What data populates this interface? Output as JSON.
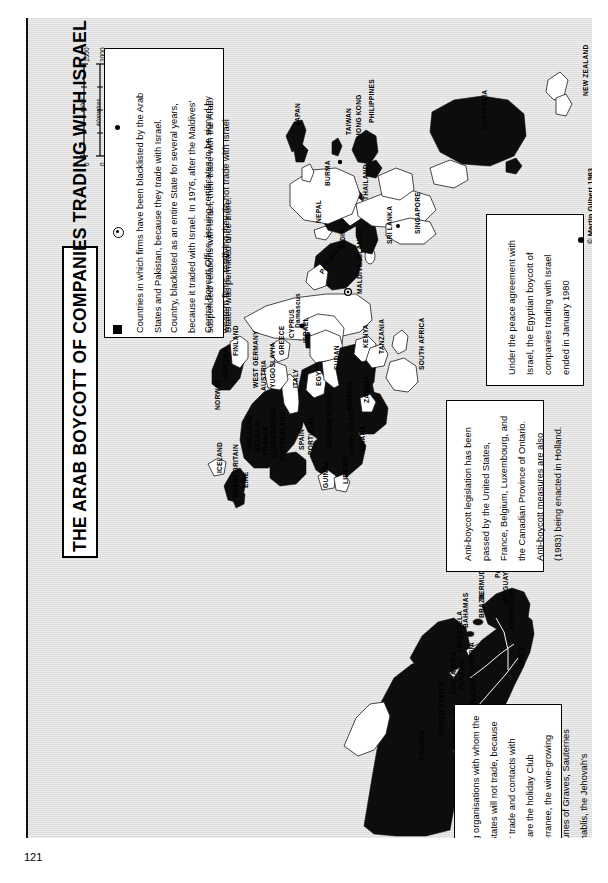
{
  "page": {
    "folio": "121",
    "credit": "© Martin Gilbert 1983"
  },
  "title": "THE ARAB BOYCOTT OF COMPANIES TRADING WITH ISRAEL",
  "scale": {
    "zero_left": "0",
    "miles_label": "miles",
    "miles_mid": "1500",
    "km_label": "kilometres",
    "km_max": "3000",
    "zero_bottom": "0"
  },
  "legend": {
    "items": [
      {
        "symbol": "filled-square",
        "text": "Countries in which firms have been blacklisted by the Arab States and Pakistan, because they trade with Israel."
      },
      {
        "symbol": "circle-dot",
        "text": "Country, blacklisted as an entire State for several years, because it traded with Israel. In 1976, after the Maldives' suspended' relations with Israel, their trade with the Arab States was permitted once more."
      },
      {
        "symbol": "dot",
        "text": "Central Boycott Office, issuing certificates to be signed by western firms, testifying they do not trade with Israel"
      }
    ]
  },
  "notes": {
    "peace": "Under the peace agreement with Israel, the Egyptian boycott of companies trading with Israel ended in January 1980",
    "anti_boycott": "Anti-boycott legislation has been passed by the United States, France, Belgium, Luxembourg, and the Canadian Province of Ontario. Anti-boycott measures are also (1983) being enacted in Holland.",
    "organisations": "Among organisations with whom the Arab States will not trade, because of their trade and contacts with Israel, are the holiday Club Mediterranee, the wine-growing communes of Graves, Sauternes and Chablis, the Jehovah's Witnesses and the Yale Glee Club"
  },
  "map_labels": [
    {
      "name": "NEW ZEALAND",
      "x": 556,
      "y": 78,
      "rot": -90
    },
    {
      "name": "AUSTRALIA",
      "x": 455,
      "y": 112,
      "rot": -90
    },
    {
      "name": "JAPAN",
      "x": 268,
      "y": 108,
      "rot": -90
    },
    {
      "name": "PHILIPPINES",
      "x": 342,
      "y": 105,
      "rot": -90
    },
    {
      "name": "TAIWAN",
      "x": 319,
      "y": 117,
      "rot": -90
    },
    {
      "name": "HONG KONG",
      "x": 329,
      "y": 120,
      "rot": -90
    },
    {
      "name": "BURMA",
      "x": 298,
      "y": 168,
      "rot": -90
    },
    {
      "name": "THAILAND",
      "x": 336,
      "y": 182,
      "rot": -90
    },
    {
      "name": "SINGAPORE",
      "x": 388,
      "y": 216,
      "rot": -90
    },
    {
      "name": "SRI LANKA",
      "x": 360,
      "y": 226,
      "rot": -90
    },
    {
      "name": "INDIA",
      "x": 313,
      "y": 230,
      "rot": -90
    },
    {
      "name": "NEPAL",
      "x": 289,
      "y": 205,
      "rot": -90
    },
    {
      "name": "PAKISTAN",
      "x": 292,
      "y": 253,
      "rot": -55
    },
    {
      "name": "MALDIVE ISLANDS",
      "x": 330,
      "y": 276,
      "rot": -90
    },
    {
      "name": "KENYA",
      "x": 336,
      "y": 330,
      "rot": -90
    },
    {
      "name": "TANZANIA",
      "x": 352,
      "y": 336,
      "rot": -90
    },
    {
      "name": "SOUTH AFRICA",
      "x": 392,
      "y": 352,
      "rot": -90
    },
    {
      "name": "ZAMBIA",
      "x": 337,
      "y": 385,
      "rot": -90
    },
    {
      "name": "NIGERIA",
      "x": 320,
      "y": 392,
      "rot": -90
    },
    {
      "name": "CHAD",
      "x": 300,
      "y": 395,
      "rot": -90
    },
    {
      "name": "SUDAN",
      "x": 307,
      "y": 352,
      "rot": -90
    },
    {
      "name": "EGYPT",
      "x": 289,
      "y": 368,
      "rot": -90
    },
    {
      "name": "GHANA",
      "x": 333,
      "y": 433,
      "rot": -90
    },
    {
      "name": "IVORY COAST",
      "x": 322,
      "y": 437,
      "rot": -90
    },
    {
      "name": "DAHOMEY",
      "x": 300,
      "y": 430,
      "rot": -90
    },
    {
      "name": "LIBERIA",
      "x": 316,
      "y": 466,
      "rot": -90
    },
    {
      "name": "GUINEA",
      "x": 296,
      "y": 470,
      "rot": -90
    },
    {
      "name": "ISRAEL",
      "x": 276,
      "y": 325,
      "rot": -90
    },
    {
      "name": "Damascus",
      "x": 268,
      "y": 310,
      "rot": -90
    },
    {
      "name": "CYPRUS",
      "x": 262,
      "y": 320,
      "rot": -90
    },
    {
      "name": "GREECE",
      "x": 252,
      "y": 337,
      "rot": -90
    },
    {
      "name": "ITALY",
      "x": 266,
      "y": 370,
      "rot": -90
    },
    {
      "name": "YUGOSLAVIA",
      "x": 243,
      "y": 370,
      "rot": -90
    },
    {
      "name": "AUSTRIA",
      "x": 234,
      "y": 373,
      "rot": -90
    },
    {
      "name": "WEST GERMANY",
      "x": 226,
      "y": 370,
      "rot": -90
    },
    {
      "name": "SPAIN",
      "x": 272,
      "y": 432,
      "rot": -90
    },
    {
      "name": "PORTUGAL",
      "x": 281,
      "y": 437,
      "rot": -90
    },
    {
      "name": "SWITZERLAND",
      "x": 253,
      "y": 444,
      "rot": -90
    },
    {
      "name": "LUXEMBOURG",
      "x": 244,
      "y": 440,
      "rot": -90
    },
    {
      "name": "FRANCE",
      "x": 236,
      "y": 437,
      "rot": -90
    },
    {
      "name": "BELGIUM",
      "x": 228,
      "y": 434,
      "rot": -90
    },
    {
      "name": "HOLLAND",
      "x": 220,
      "y": 431,
      "rot": -90
    },
    {
      "name": "EIRE",
      "x": 216,
      "y": 470,
      "rot": -90
    },
    {
      "name": "GREAT BRITAIN",
      "x": 206,
      "y": 480,
      "rot": -90
    },
    {
      "name": "FINLAND",
      "x": 206,
      "y": 338,
      "rot": -90
    },
    {
      "name": "SWEDEN",
      "x": 196,
      "y": 360,
      "rot": -90
    },
    {
      "name": "NORWAY",
      "x": 188,
      "y": 392,
      "rot": -90
    },
    {
      "name": "ICELAND",
      "x": 190,
      "y": 455,
      "rot": -90
    },
    {
      "name": "BERMUDA",
      "x": 452,
      "y": 582,
      "rot": -90
    },
    {
      "name": "BAHAMAS",
      "x": 436,
      "y": 610,
      "rot": -90
    },
    {
      "name": "VENEZUELA",
      "x": 430,
      "y": 635,
      "rot": -90
    },
    {
      "name": "COLOMBIA",
      "x": 442,
      "y": 662,
      "rot": -90
    },
    {
      "name": "PANAMA",
      "x": 432,
      "y": 672,
      "rot": -90
    },
    {
      "name": "COSTA RICA",
      "x": 424,
      "y": 676,
      "rot": -90
    },
    {
      "name": "ECUADOR",
      "x": 444,
      "y": 694,
      "rot": -90
    },
    {
      "name": "PERU",
      "x": 430,
      "y": 710,
      "rot": -90
    },
    {
      "name": "BOLIVIA",
      "x": 442,
      "y": 710,
      "rot": -90
    },
    {
      "name": "BRAZIL",
      "x": 452,
      "y": 600,
      "rot": -90
    },
    {
      "name": "PARAGUAY",
      "x": 468,
      "y": 560,
      "rot": -90
    },
    {
      "name": "URUGUAY",
      "x": 476,
      "y": 588,
      "rot": -90
    },
    {
      "name": "ARGENTINE",
      "x": 482,
      "y": 612,
      "rot": -90
    },
    {
      "name": "CHILE",
      "x": 492,
      "y": 650,
      "rot": -90
    },
    {
      "name": "MEXICO",
      "x": 426,
      "y": 730,
      "rot": -90
    },
    {
      "name": "UNITED STATES",
      "x": 412,
      "y": 718,
      "rot": -90
    },
    {
      "name": "CANADA",
      "x": 392,
      "y": 742,
      "rot": -90
    }
  ]
}
